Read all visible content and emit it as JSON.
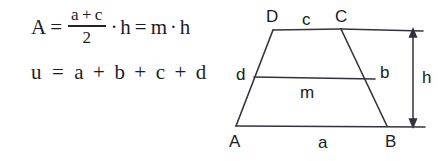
{
  "figure": {
    "title_text": "",
    "background_color": "#ffffff",
    "ink_color": "#33333d"
  },
  "formulas": {
    "area": {
      "lhs": "A",
      "equals_1": "=",
      "fraction": {
        "numerator_left": "a",
        "numerator_op": "+",
        "numerator_right": "c",
        "denominator": "2"
      },
      "dot_1": "·",
      "height_var": "h",
      "equals_2": "=",
      "midline_var": "m",
      "dot_2": "·",
      "height_var_2": "h"
    },
    "perimeter": {
      "lhs": "u",
      "equals": "=",
      "term_a": "a",
      "op_1": "+",
      "term_b": "b",
      "op_2": "+",
      "term_c": "c",
      "op_3": "+",
      "term_d": "d"
    }
  },
  "diagram": {
    "shape": "trapezoid",
    "vertices": {
      "A": "A",
      "B": "B",
      "C": "C",
      "D": "D"
    },
    "sides": {
      "bottom_base": "a",
      "right_leg": "b",
      "top_base": "c",
      "left_leg": "d"
    },
    "midline": "m",
    "height": "h"
  }
}
